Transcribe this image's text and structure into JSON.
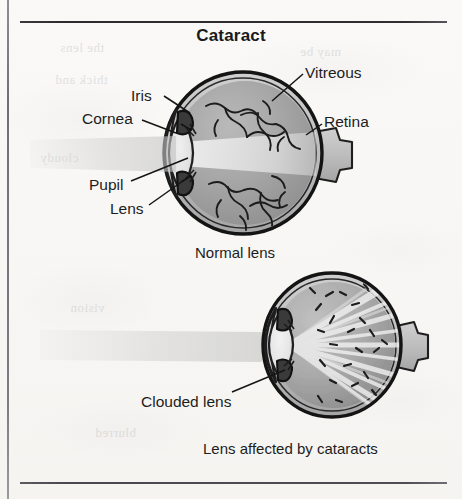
{
  "page": {
    "title": "Cataract",
    "background_color": "#f8f7f5",
    "rule_color": "#2c2c2e"
  },
  "figure": {
    "title": "Cataract",
    "normal_eye": {
      "caption": "Normal lens",
      "labels": [
        {
          "key": "iris",
          "text": "Iris"
        },
        {
          "key": "cornea",
          "text": "Cornea"
        },
        {
          "key": "pupil",
          "text": "Pupil"
        },
        {
          "key": "lens",
          "text": "Lens"
        },
        {
          "key": "vitreous",
          "text": "Vitreous"
        },
        {
          "key": "retina",
          "text": "Retina"
        }
      ]
    },
    "cataract_eye": {
      "caption": "Lens affected by cataracts",
      "labels": [
        {
          "key": "clouded_lens",
          "text": "Clouded lens"
        }
      ]
    }
  },
  "bleed_through": [
    {
      "text": "the lens"
    },
    {
      "text": "may be"
    },
    {
      "text": "thick and"
    },
    {
      "text": "cloudy"
    },
    {
      "text": "vision"
    },
    {
      "text": "blurred"
    }
  ]
}
